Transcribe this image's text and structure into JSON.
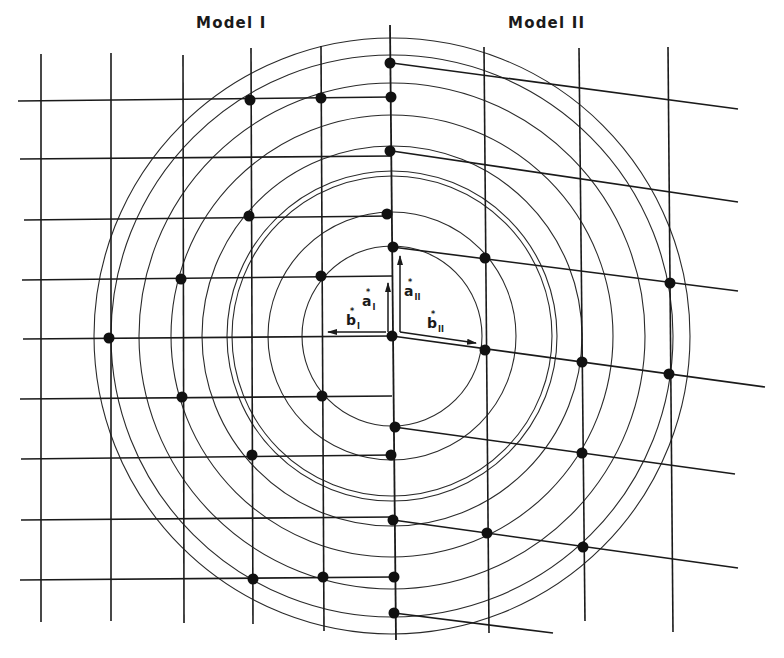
{
  "titles": {
    "model_1": "Model I",
    "model_2": "Model II"
  },
  "colors": {
    "line": "#1a1a1a",
    "ring": "#2a2a2a",
    "dot": "#111111",
    "background": "#ffffff"
  },
  "center": [
    392,
    336
  ],
  "rings": {
    "radii": [
      90,
      124,
      160,
      165,
      190,
      221,
      253,
      281,
      298
    ]
  },
  "model_1": {
    "vertical_lines": [
      {
        "x1": 41,
        "y1": 54,
        "x2": 41,
        "y2": 622
      },
      {
        "x1": 111,
        "y1": 53,
        "x2": 111,
        "y2": 621
      },
      {
        "x1": 183,
        "y1": 55,
        "x2": 184,
        "y2": 623
      },
      {
        "x1": 251,
        "y1": 48,
        "x2": 253,
        "y2": 624
      },
      {
        "x1": 321,
        "y1": 46,
        "x2": 324,
        "y2": 631
      }
    ],
    "horizontal_lines": [
      {
        "x1": 18,
        "y1": 101,
        "x2": 392,
        "y2": 97
      },
      {
        "x1": 20,
        "y1": 159,
        "x2": 392,
        "y2": 156
      },
      {
        "x1": 24,
        "y1": 220,
        "x2": 392,
        "y2": 216
      },
      {
        "x1": 22,
        "y1": 280,
        "x2": 392,
        "y2": 276
      },
      {
        "x1": 23,
        "y1": 339,
        "x2": 392,
        "y2": 336
      },
      {
        "x1": 20,
        "y1": 399,
        "x2": 392,
        "y2": 396
      },
      {
        "x1": 21,
        "y1": 459,
        "x2": 392,
        "y2": 455
      },
      {
        "x1": 21,
        "y1": 520,
        "x2": 392,
        "y2": 517
      },
      {
        "x1": 20,
        "y1": 580,
        "x2": 392,
        "y2": 577
      }
    ],
    "dots": [
      [
        250,
        100
      ],
      [
        321,
        98
      ],
      [
        391,
        97
      ],
      [
        249,
        216
      ],
      [
        181,
        279
      ],
      [
        321,
        276
      ],
      [
        109,
        338
      ],
      [
        182,
        397
      ],
      [
        322,
        396
      ],
      [
        252,
        455
      ],
      [
        253,
        579
      ],
      [
        323,
        577
      ],
      [
        394,
        577
      ]
    ]
  },
  "center_line": {
    "x1": 390,
    "y1": 25,
    "x2": 396,
    "y2": 640
  },
  "model_2": {
    "vertical_lines": [
      {
        "x1": 484,
        "y1": 47,
        "x2": 489,
        "y2": 633
      },
      {
        "x1": 579,
        "y1": 48,
        "x2": 585,
        "y2": 621
      },
      {
        "x1": 668,
        "y1": 47,
        "x2": 673,
        "y2": 632
      }
    ],
    "tilted_lines": [
      {
        "x1": 392,
        "y1": 63,
        "x2": 738,
        "y2": 109
      },
      {
        "x1": 392,
        "y1": 151,
        "x2": 738,
        "y2": 202
      },
      {
        "x1": 392,
        "y1": 247,
        "x2": 738,
        "y2": 291
      },
      {
        "x1": 392,
        "y1": 336,
        "x2": 765,
        "y2": 387
      },
      {
        "x1": 394,
        "y1": 427,
        "x2": 735,
        "y2": 474
      },
      {
        "x1": 393,
        "y1": 520,
        "x2": 738,
        "y2": 568
      },
      {
        "x1": 394,
        "y1": 613,
        "x2": 553,
        "y2": 633
      }
    ],
    "dots": [
      [
        485,
        258
      ],
      [
        670,
        283
      ],
      [
        485,
        350
      ],
      [
        582,
        362
      ],
      [
        669,
        374
      ],
      [
        582,
        453
      ],
      [
        487,
        533
      ],
      [
        583,
        547
      ]
    ]
  },
  "center_dots": [
    [
      390,
      63
    ],
    [
      390,
      151
    ],
    [
      392,
      336
    ],
    [
      387,
      214
    ],
    [
      393,
      247
    ],
    [
      395,
      427
    ],
    [
      391,
      455
    ],
    [
      393,
      520
    ],
    [
      394,
      613
    ]
  ],
  "vectors": {
    "a1": {
      "x1": 388,
      "y1": 332,
      "x2": 388,
      "y2": 283,
      "label": "a",
      "sup": "*",
      "sub": "I",
      "lx": 362,
      "ly": 294
    },
    "b1": {
      "x1": 386,
      "y1": 332,
      "x2": 328,
      "y2": 332,
      "label": "b",
      "sup": "*",
      "sub": "I",
      "lx": 346,
      "ly": 313
    },
    "a2": {
      "x1": 400,
      "y1": 332,
      "x2": 400,
      "y2": 256,
      "label": "a",
      "sup": "*",
      "sub": "II",
      "lx": 404,
      "ly": 284
    },
    "b2": {
      "x1": 400,
      "y1": 332,
      "x2": 476,
      "y2": 343,
      "label": "b",
      "sup": "*",
      "sub": "II",
      "lx": 427,
      "ly": 316
    }
  }
}
